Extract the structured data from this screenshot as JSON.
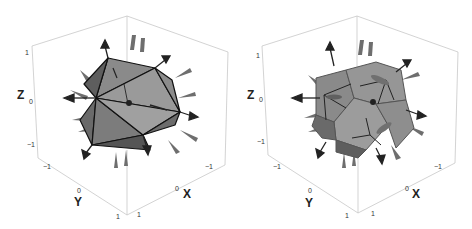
{
  "figure": {
    "panels": [
      {
        "id": "icosahedron",
        "shape": "icosahedron with normal vector arrows",
        "axes": {
          "z_title": "Z",
          "y_title": "Y",
          "x_title": "X",
          "z_ticks": [
            "1",
            "0",
            "−1"
          ],
          "y_ticks": [
            "−1",
            "0",
            "1"
          ],
          "x_ticks": [
            "1",
            "0",
            "−1"
          ]
        }
      },
      {
        "id": "dodecahedron",
        "shape": "dodecahedron with normal vector arrows",
        "axes": {
          "z_title": "Z",
          "y_title": "Y",
          "x_title": "X",
          "z_ticks": [
            "1",
            "0",
            "−1"
          ],
          "y_ticks": [
            "−1",
            "0",
            "1"
          ],
          "x_ticks": [
            "1",
            "0",
            "−1"
          ]
        }
      }
    ],
    "colors": {
      "box": "#c8c8c8",
      "face_light": "#9a9a9a",
      "face_mid": "#7c7c7c",
      "face_dark": "#5a5a5a",
      "edge": "#111111",
      "arrow": "#2a2a2a",
      "arrow_light": "#6e6e6e"
    }
  }
}
